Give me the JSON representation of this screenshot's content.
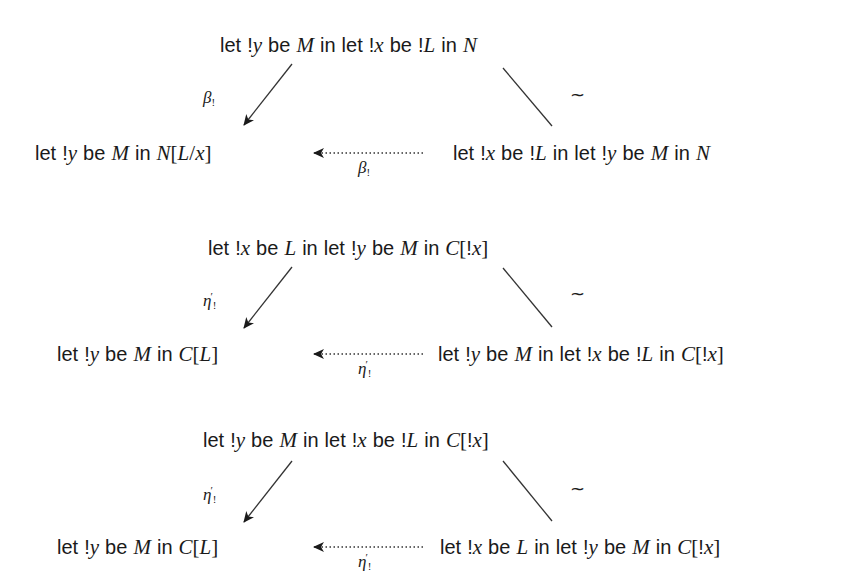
{
  "diagrams": [
    {
      "top": "let !y be M in let !x be !L in N",
      "bottom_left": "let !y be M in N[L/x]",
      "bottom_right": "let !x be !L in let !y be M in N",
      "left_arrow_label": {
        "base": "β",
        "sub": "!",
        "sup": ""
      },
      "bottom_arrow_label": {
        "base": "β",
        "sub": "!",
        "sup": ""
      },
      "right_edge_label": "~"
    },
    {
      "top": "let !x be L in let !y be M in C[!x]",
      "bottom_left": "let !y be M in C[L]",
      "bottom_right": "let !y be M in let !x be !L in C[!x]",
      "left_arrow_label": {
        "base": "η",
        "sub": "!",
        "sup": "′"
      },
      "bottom_arrow_label": {
        "base": "η",
        "sub": "!",
        "sup": "′"
      },
      "right_edge_label": "~"
    },
    {
      "top": "let !y be M in let !x be !L in C[!x]",
      "bottom_left": "let !y be M in C[L]",
      "bottom_right": "let !x be L in let !y be M in C[!x]",
      "left_arrow_label": {
        "base": "η",
        "sub": "!",
        "sup": "′"
      },
      "bottom_arrow_label": {
        "base": "η",
        "sub": "!",
        "sup": "′"
      },
      "right_edge_label": "~"
    }
  ],
  "colors": {
    "ink": "#1a1a1a",
    "background": "#ffffff"
  }
}
